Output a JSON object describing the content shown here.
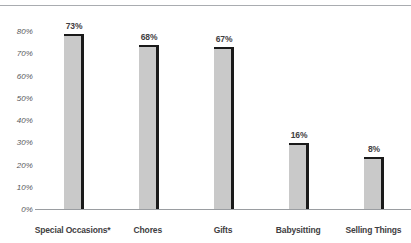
{
  "chart_data": {
    "type": "bar",
    "title": "",
    "subtitle": "",
    "xlabel": "",
    "ylabel": "",
    "ylim": [
      0,
      80
    ],
    "grid": false,
    "legend": false,
    "legend_position": "none",
    "categories": [
      "Special Occasions*",
      "Chores",
      "Gifts",
      "Babysitting",
      "Selling Things"
    ],
    "values": [
      73,
      68,
      67,
      16,
      8
    ],
    "value_labels": [
      "73%",
      "68%",
      "67%",
      "16%",
      "8%"
    ],
    "ytick_labels": [
      "80%",
      "70%",
      "60%",
      "50%",
      "40%",
      "30%",
      "20%",
      "10%",
      "0%"
    ],
    "ytick_values": [
      80,
      70,
      60,
      50,
      40,
      30,
      20,
      10,
      0
    ],
    "bar_color": "#c9c9c9",
    "bar_edge_color": "#1a1a1a",
    "axis_color": "#9a9da1",
    "label_color": "#3f4042",
    "tick_color": "#58595b"
  }
}
